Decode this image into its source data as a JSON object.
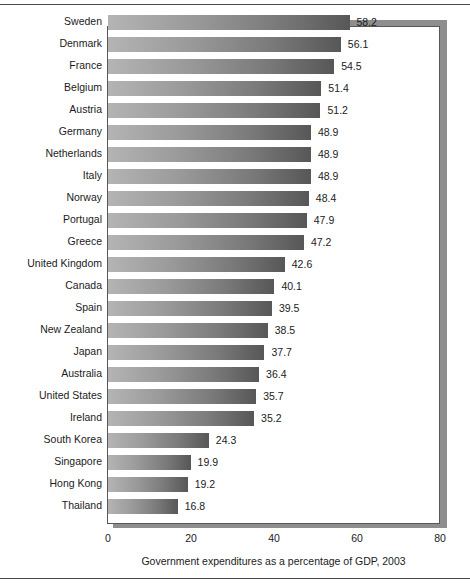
{
  "chart_data": {
    "type": "bar",
    "orientation": "horizontal",
    "title": "",
    "xlabel": "Government expenditures as a percentage of GDP, 2003",
    "ylabel": "",
    "xlim": [
      0,
      80
    ],
    "xticks": [
      0,
      20,
      40,
      60,
      80
    ],
    "xtick_labels": [
      "0",
      "20",
      "40",
      "60",
      "80"
    ],
    "grid": false,
    "legend": null,
    "bar_value_labels": true,
    "categories": [
      "Sweden",
      "Denmark",
      "France",
      "Belgium",
      "Austria",
      "Germany",
      "Netherlands",
      "Italy",
      "Norway",
      "Portugal",
      "Greece",
      "United Kingdom",
      "Canada",
      "Spain",
      "New Zealand",
      "Japan",
      "Australia",
      "United States",
      "Ireland",
      "South Korea",
      "Singapore",
      "Hong Kong",
      "Thailand"
    ],
    "values": [
      58.2,
      56.1,
      54.5,
      51.4,
      51.2,
      48.9,
      48.9,
      48.9,
      48.4,
      47.9,
      47.2,
      42.6,
      40.1,
      39.5,
      38.5,
      37.7,
      36.4,
      35.7,
      35.2,
      24.3,
      19.9,
      19.2,
      16.8
    ],
    "value_labels": [
      "58.2",
      "56.1",
      "54.5",
      "51.4",
      "51.2",
      "48.9",
      "48.9",
      "48.9",
      "48.4",
      "47.9",
      "47.2",
      "42.6",
      "40.1",
      "39.5",
      "38.5",
      "37.7",
      "36.4",
      "35.7",
      "35.2",
      "24.3",
      "19.9",
      "19.2",
      "16.8"
    ],
    "colors": {
      "bar_gradient_start": "#b4b4b4",
      "bar_gradient_end": "#575757",
      "frame_border": "#575757",
      "frame_shadow": "#8e8e8e",
      "plot_background": "#ffffff",
      "text": "#1b1b1b",
      "page_rule": "#4a4a4a"
    }
  }
}
